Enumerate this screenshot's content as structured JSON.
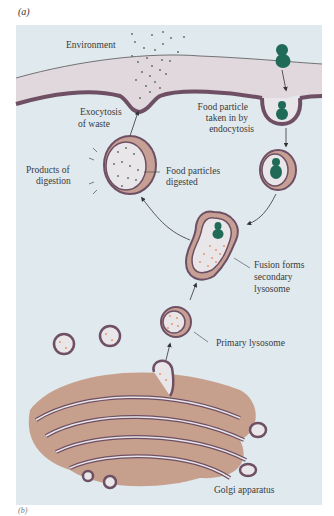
{
  "figure": {
    "panel_a_label": "(a)",
    "panel_b_label": "(b)",
    "colors": {
      "background": "#dfe9ee",
      "cytoplasm_membrane": "#6e4f63",
      "extracellular_band": "#e1d8dd",
      "vesicle_interior": "#e9e6ea",
      "food_particle": "#1f6b58",
      "enzyme_dots": "#e8946a",
      "golgi_fill": "#c6a08c",
      "arrow": "#333333"
    }
  },
  "labels": {
    "environment": "Environment",
    "food_particle_1": "Food particle",
    "food_particle_2": "taken in by",
    "food_particle_3": "endocytosis",
    "exocytosis_1": "Exocytosis",
    "exocytosis_2": "of waste",
    "products_1": "Products of",
    "products_2": "digestion",
    "digested_1": "Food particles",
    "digested_2": "digested",
    "fusion_1": "Fusion forms",
    "fusion_2": "secondary",
    "fusion_3": "lysosome",
    "primary_lysosome": "Primary lysosome",
    "golgi": "Golgi apparatus"
  }
}
